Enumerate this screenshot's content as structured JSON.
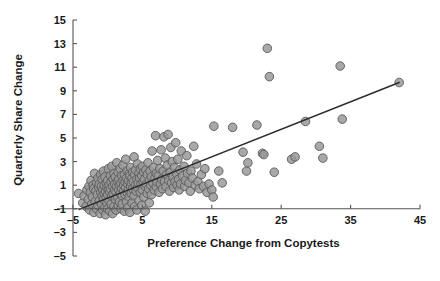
{
  "chart_data": {
    "type": "scatter",
    "title": "",
    "xlabel": "Preference Change from Copytests",
    "ylabel": "Quarterly Share Change",
    "xlim": [
      -6,
      46
    ],
    "ylim": [
      -5.6,
      15.4
    ],
    "xticks": [
      -5,
      5,
      15,
      25,
      35,
      45
    ],
    "xticklabels": [
      "-5",
      "5",
      "15",
      "25",
      "35",
      "45"
    ],
    "yticks": [
      -5,
      -3,
      -1,
      1,
      3,
      5,
      7,
      9,
      11,
      13,
      15
    ],
    "yticklabels": [
      "-5",
      "-3",
      "-1",
      "1",
      "3",
      "5",
      "7",
      "9",
      "11",
      "13",
      "15"
    ],
    "grid": false,
    "legend": false,
    "marker": {
      "shape": "circle",
      "fill_color": "#999999",
      "edge_color": "#595959",
      "size_px": 8.6,
      "opacity": 0.85
    },
    "trendline": {
      "label": "regression line",
      "color": "#2b2b2b",
      "x_start": -4.1,
      "y_start": -1.05,
      "x_end": 42.0,
      "y_end": 9.7
    },
    "points": [
      [
        -4.2,
        0.3
      ],
      [
        -3.6,
        -0.5
      ],
      [
        -3.4,
        0.1
      ],
      [
        -3.1,
        -0.8
      ],
      [
        -3.0,
        0.6
      ],
      [
        -2.8,
        -0.2
      ],
      [
        -2.7,
        0.9
      ],
      [
        -2.6,
        -1.1
      ],
      [
        -2.5,
        0.4
      ],
      [
        -2.4,
        1.4
      ],
      [
        -2.3,
        -0.6
      ],
      [
        -2.2,
        0.0
      ],
      [
        -2.1,
        1.0
      ],
      [
        -2.0,
        -1.3
      ],
      [
        -2.0,
        0.7
      ],
      [
        -1.9,
        2.0
      ],
      [
        -1.8,
        -0.4
      ],
      [
        -1.7,
        0.5
      ],
      [
        -1.6,
        -1.0
      ],
      [
        -1.6,
        1.2
      ],
      [
        -1.5,
        0.2
      ],
      [
        -1.4,
        -0.7
      ],
      [
        -1.4,
        1.6
      ],
      [
        -1.3,
        0.8
      ],
      [
        -1.2,
        -0.3
      ],
      [
        -1.2,
        1.1
      ],
      [
        -1.1,
        -1.4
      ],
      [
        -1.0,
        0.4
      ],
      [
        -1.0,
        1.9
      ],
      [
        -0.9,
        -0.6
      ],
      [
        -0.9,
        0.9
      ],
      [
        -0.8,
        0.1
      ],
      [
        -0.8,
        1.5
      ],
      [
        -0.7,
        -1.1
      ],
      [
        -0.7,
        0.6
      ],
      [
        -0.6,
        2.2
      ],
      [
        -0.6,
        -0.2
      ],
      [
        -0.5,
        1.0
      ],
      [
        -0.5,
        0.3
      ],
      [
        -0.4,
        -0.9
      ],
      [
        -0.4,
        1.7
      ],
      [
        -0.3,
        0.5
      ],
      [
        -0.3,
        -1.5
      ],
      [
        -0.2,
        1.2
      ],
      [
        -0.2,
        0.0
      ],
      [
        -0.1,
        0.8
      ],
      [
        -0.1,
        -0.5
      ],
      [
        0.0,
        1.4
      ],
      [
        0.0,
        0.2
      ],
      [
        0.0,
        -1.0
      ],
      [
        0.1,
        0.6
      ],
      [
        0.1,
        2.4
      ],
      [
        0.2,
        -0.3
      ],
      [
        0.2,
        1.0
      ],
      [
        0.3,
        0.4
      ],
      [
        0.3,
        -1.2
      ],
      [
        0.4,
        1.8
      ],
      [
        0.4,
        0.7
      ],
      [
        0.5,
        -0.6
      ],
      [
        0.5,
        1.3
      ],
      [
        0.6,
        0.1
      ],
      [
        0.6,
        2.6
      ],
      [
        0.7,
        -1.4
      ],
      [
        0.7,
        0.9
      ],
      [
        0.8,
        1.5
      ],
      [
        0.8,
        0.3
      ],
      [
        0.9,
        -0.8
      ],
      [
        0.9,
        2.0
      ],
      [
        1.0,
        0.6
      ],
      [
        1.0,
        1.1
      ],
      [
        1.1,
        -0.2
      ],
      [
        1.1,
        1.7
      ],
      [
        1.2,
        0.4
      ],
      [
        1.2,
        -1.1
      ],
      [
        1.3,
        2.9
      ],
      [
        1.3,
        0.9
      ],
      [
        1.4,
        1.3
      ],
      [
        1.4,
        0.0
      ],
      [
        1.5,
        -0.7
      ],
      [
        1.5,
        2.1
      ],
      [
        1.6,
        0.6
      ],
      [
        1.6,
        1.5
      ],
      [
        1.7,
        -0.4
      ],
      [
        1.7,
        1.0
      ],
      [
        1.8,
        0.3
      ],
      [
        1.8,
        2.4
      ],
      [
        1.9,
        -1.0
      ],
      [
        1.9,
        1.2
      ],
      [
        2.0,
        0.7
      ],
      [
        2.0,
        1.8
      ],
      [
        2.1,
        0.1
      ],
      [
        2.1,
        -0.6
      ],
      [
        2.2,
        1.4
      ],
      [
        2.2,
        2.7
      ],
      [
        2.3,
        0.5
      ],
      [
        2.3,
        1.0
      ],
      [
        2.4,
        -1.2
      ],
      [
        2.4,
        1.9
      ],
      [
        2.5,
        0.2
      ],
      [
        2.5,
        1.3
      ],
      [
        2.6,
        0.8
      ],
      [
        2.6,
        3.2
      ],
      [
        2.7,
        -0.4
      ],
      [
        2.7,
        1.6
      ],
      [
        2.8,
        0.4
      ],
      [
        2.8,
        2.2
      ],
      [
        2.9,
        1.1
      ],
      [
        2.9,
        -0.9
      ],
      [
        3.0,
        0.6
      ],
      [
        3.0,
        1.4
      ],
      [
        3.1,
        2.0
      ],
      [
        3.1,
        0.0
      ],
      [
        3.2,
        1.8
      ],
      [
        3.2,
        -1.3
      ],
      [
        3.3,
        0.9
      ],
      [
        3.3,
        2.5
      ],
      [
        3.4,
        1.2
      ],
      [
        3.4,
        0.3
      ],
      [
        3.5,
        1.6
      ],
      [
        3.5,
        -0.5
      ],
      [
        3.6,
        2.1
      ],
      [
        3.6,
        0.7
      ],
      [
        3.7,
        1.3
      ],
      [
        3.8,
        3.4
      ],
      [
        3.8,
        0.1
      ],
      [
        3.9,
        1.9
      ],
      [
        3.9,
        -0.8
      ],
      [
        4.0,
        1.0
      ],
      [
        4.0,
        2.3
      ],
      [
        4.1,
        0.5
      ],
      [
        4.2,
        1.5
      ],
      [
        4.2,
        -1.1
      ],
      [
        4.3,
        2.8
      ],
      [
        4.3,
        0.8
      ],
      [
        4.4,
        1.2
      ],
      [
        4.5,
        2.0
      ],
      [
        4.5,
        -0.3
      ],
      [
        4.6,
        1.6
      ],
      [
        4.7,
        0.4
      ],
      [
        4.7,
        2.4
      ],
      [
        4.8,
        1.1
      ],
      [
        4.9,
        -0.7
      ],
      [
        4.9,
        1.8
      ],
      [
        5.0,
        0.6
      ],
      [
        5.0,
        2.6
      ],
      [
        5.1,
        1.3
      ],
      [
        5.2,
        0.0
      ],
      [
        5.2,
        2.1
      ],
      [
        5.3,
        1.5
      ],
      [
        5.4,
        -1.2
      ],
      [
        5.4,
        0.9
      ],
      [
        5.5,
        2.3
      ],
      [
        5.6,
        1.1
      ],
      [
        5.7,
        0.3
      ],
      [
        5.7,
        1.9
      ],
      [
        5.8,
        2.9
      ],
      [
        5.9,
        0.7
      ],
      [
        6.0,
        1.4
      ],
      [
        6.0,
        -0.5
      ],
      [
        6.1,
        2.2
      ],
      [
        6.2,
        1.0
      ],
      [
        6.3,
        1.7
      ],
      [
        6.3,
        0.2
      ],
      [
        6.4,
        3.9
      ],
      [
        6.5,
        1.2
      ],
      [
        6.6,
        2.5
      ],
      [
        6.7,
        0.6
      ],
      [
        6.8,
        1.6
      ],
      [
        6.9,
        5.2
      ],
      [
        7.0,
        2.0
      ],
      [
        7.0,
        0.9
      ],
      [
        7.1,
        1.3
      ],
      [
        7.2,
        3.1
      ],
      [
        7.3,
        1.8
      ],
      [
        7.4,
        0.4
      ],
      [
        7.5,
        2.4
      ],
      [
        7.6,
        1.1
      ],
      [
        7.7,
        4.0
      ],
      [
        7.8,
        1.5
      ],
      [
        7.9,
        0.7
      ],
      [
        8.0,
        2.2
      ],
      [
        8.1,
        5.1
      ],
      [
        8.2,
        1.3
      ],
      [
        8.3,
        3.3
      ],
      [
        8.4,
        0.9
      ],
      [
        8.5,
        1.9
      ],
      [
        8.6,
        2.7
      ],
      [
        8.7,
        5.3
      ],
      [
        8.8,
        1.4
      ],
      [
        8.9,
        0.5
      ],
      [
        9.0,
        2.1
      ],
      [
        9.1,
        4.2
      ],
      [
        9.2,
        1.2
      ],
      [
        9.3,
        3.0
      ],
      [
        9.4,
        1.7
      ],
      [
        9.5,
        0.8
      ],
      [
        9.6,
        2.5
      ],
      [
        9.7,
        1.3
      ],
      [
        9.8,
        4.6
      ],
      [
        9.9,
        2.0
      ],
      [
        10.0,
        1.0
      ],
      [
        10.1,
        3.2
      ],
      [
        10.2,
        1.5
      ],
      [
        10.3,
        0.6
      ],
      [
        10.4,
        2.3
      ],
      [
        10.5,
        1.1
      ],
      [
        10.6,
        3.9
      ],
      [
        10.8,
        1.8
      ],
      [
        11.0,
        2.6
      ],
      [
        11.1,
        0.9
      ],
      [
        11.2,
        1.4
      ],
      [
        11.4,
        3.5
      ],
      [
        11.5,
        2.0
      ],
      [
        11.7,
        1.2
      ],
      [
        11.9,
        0.5
      ],
      [
        12.0,
        2.2
      ],
      [
        12.2,
        1.6
      ],
      [
        12.4,
        4.3
      ],
      [
        12.6,
        1.0
      ],
      [
        12.8,
        2.8
      ],
      [
        13.0,
        1.3
      ],
      [
        13.2,
        0.7
      ],
      [
        13.5,
        1.9
      ],
      [
        13.8,
        0.9
      ],
      [
        14.0,
        2.4
      ],
      [
        14.3,
        0.4
      ],
      [
        14.6,
        1.1
      ],
      [
        15.0,
        0.6
      ],
      [
        15.2,
        0.0
      ],
      [
        15.3,
        6.0
      ],
      [
        16.0,
        2.2
      ],
      [
        16.5,
        1.2
      ],
      [
        18.0,
        5.9
      ],
      [
        19.5,
        3.8
      ],
      [
        20.0,
        2.2
      ],
      [
        20.2,
        2.9
      ],
      [
        21.5,
        6.1
      ],
      [
        22.3,
        3.7
      ],
      [
        22.5,
        3.6
      ],
      [
        23.0,
        12.6
      ],
      [
        23.3,
        10.2
      ],
      [
        24.0,
        2.1
      ],
      [
        26.5,
        3.2
      ],
      [
        27.0,
        3.4
      ],
      [
        28.5,
        6.4
      ],
      [
        30.5,
        4.3
      ],
      [
        31.0,
        3.3
      ],
      [
        33.5,
        11.1
      ],
      [
        33.8,
        6.6
      ],
      [
        42.0,
        9.7
      ]
    ]
  },
  "axis_titles": {
    "x": "Preference Change from Copytests",
    "y": "Quarterly Share Change"
  }
}
